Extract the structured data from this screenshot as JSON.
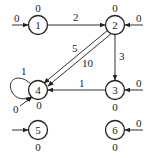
{
  "diagram": {
    "type": "directed-graph",
    "nodes": [
      {
        "id": "1",
        "label": "1",
        "cx": 38,
        "cy": 25,
        "top_label": "0",
        "bottom_label": null,
        "input": {
          "label": "0",
          "from": "left"
        }
      },
      {
        "id": "2",
        "label": "2",
        "cx": 115,
        "cy": 25,
        "top_label": "0",
        "bottom_label": null,
        "input": {
          "label": "0",
          "from": "right"
        }
      },
      {
        "id": "3",
        "label": "3",
        "cx": 115,
        "cy": 90,
        "top_label": null,
        "bottom_label": "0",
        "input": {
          "label": "0",
          "from": "right"
        }
      },
      {
        "id": "4",
        "label": "4",
        "cx": 38,
        "cy": 90,
        "top_label": null,
        "bottom_label": "0",
        "input": {
          "label": "0",
          "from": "bottom-left"
        }
      },
      {
        "id": "5",
        "label": "5",
        "cx": 38,
        "cy": 130,
        "top_label": null,
        "bottom_label": "0",
        "input": {
          "label": "",
          "from": "left"
        }
      },
      {
        "id": "6",
        "label": "6",
        "cx": 115,
        "cy": 130,
        "top_label": null,
        "bottom_label": "0",
        "input": {
          "label": "0",
          "from": "right"
        }
      }
    ],
    "edges": [
      {
        "from": "1",
        "to": "2",
        "label": "2"
      },
      {
        "from": "2",
        "to": "4",
        "label": "5"
      },
      {
        "from": "2",
        "to": "4",
        "label": "10"
      },
      {
        "from": "2",
        "to": "3",
        "label": "3"
      },
      {
        "from": "3",
        "to": "4",
        "label": "1"
      },
      {
        "from": "4",
        "to": "4",
        "label": "1",
        "self_loop": true
      }
    ]
  }
}
